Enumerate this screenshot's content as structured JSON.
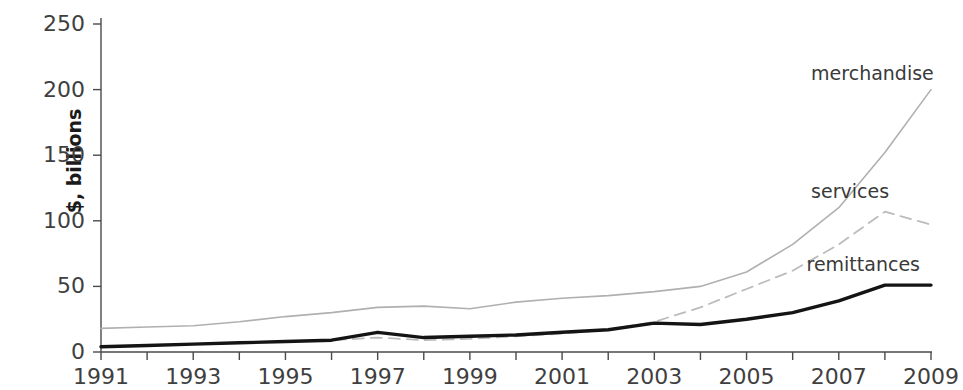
{
  "chart_data": {
    "type": "line",
    "title": "",
    "subtitle": "",
    "xlabel": "",
    "ylabel": "$, billions",
    "xlim": [
      1991,
      2009
    ],
    "ylim": [
      0,
      250
    ],
    "ytick_labels": [
      "250",
      "200",
      "150",
      "100",
      "50",
      "0"
    ],
    "ytick_values": [
      250,
      200,
      150,
      100,
      50,
      0
    ],
    "xtick_labels": [
      "1991",
      "1993",
      "1995",
      "1997",
      "1999",
      "2001",
      "2003",
      "2005",
      "2007",
      "2009"
    ],
    "xtick_values": [
      1991,
      1993,
      1995,
      1997,
      1999,
      2001,
      2003,
      2005,
      2007,
      2009
    ],
    "x": [
      1991,
      1992,
      1993,
      1994,
      1995,
      1996,
      1997,
      1998,
      1999,
      2000,
      2001,
      2002,
      2003,
      2004,
      2005,
      2006,
      2007,
      2008,
      2009
    ],
    "grid": false,
    "legend_position": "inline-annotations",
    "series": [
      {
        "name": "merchandise",
        "color": "#b0b0b0",
        "style": "solid",
        "width": 1.6,
        "label_x": 2006.4,
        "label_y": 212,
        "values": [
          18,
          19,
          20,
          23,
          27,
          30,
          34,
          35,
          33,
          38,
          41,
          43,
          46,
          50,
          61,
          82,
          110,
          152,
          200
        ]
      },
      {
        "name": "services",
        "color": "#bcbcbc",
        "style": "dashed",
        "width": 1.8,
        "label_x": 2006.4,
        "label_y": 122,
        "values": [
          4,
          5,
          6,
          7,
          8,
          9,
          11,
          9,
          10,
          12,
          14,
          17,
          23,
          34,
          48,
          62,
          82,
          107,
          97
        ]
      },
      {
        "name": "remittances",
        "color": "#141414",
        "style": "solid",
        "width": 3.4,
        "label_x": 2006.3,
        "label_y": 66,
        "values": [
          4,
          5,
          6,
          7,
          8,
          9,
          15,
          11,
          12,
          13,
          15,
          17,
          22,
          21,
          25,
          30,
          39,
          51,
          51
        ]
      }
    ],
    "series_annotations": [
      {
        "name": "merchandise-label",
        "text": "merchandise"
      },
      {
        "name": "services-label",
        "text": "services"
      },
      {
        "name": "remittances-label",
        "text": "remittances"
      }
    ],
    "axis_color": "#4a4a4a"
  }
}
